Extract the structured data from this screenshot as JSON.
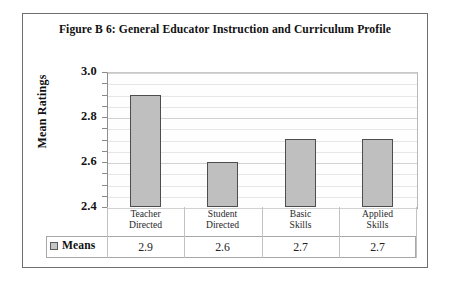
{
  "chart_data": {
    "type": "bar",
    "title": "Figure B 6: General Educator Instruction and Curriculum Profile",
    "xlabel": "",
    "ylabel": "Mean Ratings",
    "categories": [
      "Teacher Directed",
      "Student Directed",
      "Basic Skills",
      "Applied Skills"
    ],
    "category_lines": [
      [
        "Teacher",
        "Directed"
      ],
      [
        "Student",
        "Directed"
      ],
      [
        "Basic",
        "Skills"
      ],
      [
        "Applied",
        "Skills"
      ]
    ],
    "series": [
      {
        "name": "Means",
        "values": [
          2.9,
          2.6,
          2.7,
          2.7
        ],
        "value_labels": [
          "2.9",
          "2.6",
          "2.7",
          "2.7"
        ],
        "color": "#BFBFBF"
      }
    ],
    "ylim": [
      2.4,
      3.0
    ],
    "ytick_labels": [
      "3.0",
      "2.8",
      "2.6",
      "2.4"
    ],
    "ytick_values": [
      3.0,
      2.8,
      2.6,
      2.4
    ],
    "minor_tick_step": 0.05,
    "grid": true,
    "legend_position": "bottom-table",
    "has_data_table": true
  },
  "figure": {
    "title": "Figure B 6: General Educator Instruction and Curriculum Profile",
    "y_axis_title": "Mean Ratings",
    "legend_label": "Means"
  },
  "colors": {
    "bar_fill": "#BFBFBF",
    "bar_outline": "#4D4D4D",
    "grid": "#D2D2D2",
    "frame": "#6E6E6E",
    "plot_background": "#FEFEFE"
  }
}
